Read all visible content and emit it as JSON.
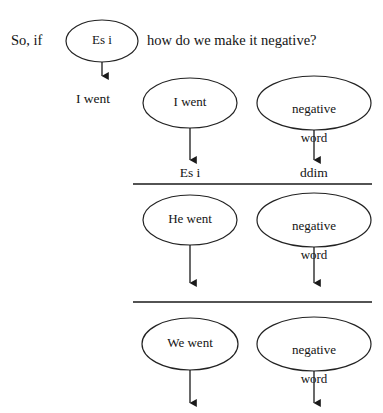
{
  "diagram": {
    "stroke_color": "#222222",
    "background_color": "#ffffff",
    "text_color": "#141414",
    "intro": {
      "lead_text": "So, if",
      "question_text": "how do we make it negative?",
      "subject_answer": "I went"
    },
    "column_headers": [
      {
        "label": "Es i",
        "x": 190
      },
      {
        "label": "ddim",
        "x": 314
      }
    ],
    "nodes": [
      {
        "id": "node-es-i",
        "label": "Es i",
        "row": 1,
        "column": "left",
        "cx": 102,
        "cy": 41,
        "rx": 36,
        "ry": 21
      },
      {
        "id": "node-i-went-row2",
        "label": "I went",
        "row": 2,
        "column": "left",
        "cx": 190,
        "cy": 103,
        "rx": 47,
        "ry": 25
      },
      {
        "id": "node-negative-word-row2",
        "label": "negative\nword",
        "label_line1": "negative",
        "label_line2": "word",
        "row": 2,
        "column": "right",
        "cx": 314,
        "cy": 103,
        "rx": 57,
        "ry": 27
      },
      {
        "id": "node-he-went",
        "label": "He went",
        "row": 3,
        "column": "left",
        "cx": 190,
        "cy": 220,
        "rx": 47,
        "ry": 25
      },
      {
        "id": "node-negative-word-row3",
        "label": "negative\nword",
        "label_line1": "negative",
        "label_line2": "word",
        "row": 3,
        "column": "right",
        "cx": 314,
        "cy": 220,
        "rx": 57,
        "ry": 27
      },
      {
        "id": "node-we-went",
        "label": "We went",
        "row": 4,
        "column": "left",
        "cx": 190,
        "cy": 344,
        "rx": 48,
        "ry": 26
      },
      {
        "id": "node-negative-word-row4",
        "label": "negative\nword",
        "label_line1": "negative",
        "label_line2": "word",
        "row": 4,
        "column": "right",
        "cx": 314,
        "cy": 344,
        "rx": 57,
        "ry": 27
      }
    ],
    "dividers": [
      {
        "id": "divider-top",
        "x1": 133,
        "x2": 372,
        "y": 184
      },
      {
        "id": "divider-bottom",
        "x1": 133,
        "x2": 372,
        "y": 302
      }
    ],
    "arrows": [
      {
        "id": "arrow-es-i-to-i-went",
        "x": 102,
        "y1": 62,
        "y2": 78
      },
      {
        "id": "arrow-i-went-row2-down",
        "x": 190,
        "y1": 128,
        "y2": 162
      },
      {
        "id": "arrow-negative-word-row2-down",
        "x": 314,
        "y1": 130,
        "y2": 162
      },
      {
        "id": "arrow-he-went-down",
        "x": 190,
        "y1": 245,
        "y2": 285
      },
      {
        "id": "arrow-negative-word-row3-down",
        "x": 314,
        "y1": 247,
        "y2": 285
      },
      {
        "id": "arrow-we-went-down",
        "x": 190,
        "y1": 370,
        "y2": 405
      },
      {
        "id": "arrow-negative-word-row4-down",
        "x": 314,
        "y1": 371,
        "y2": 405
      }
    ]
  }
}
